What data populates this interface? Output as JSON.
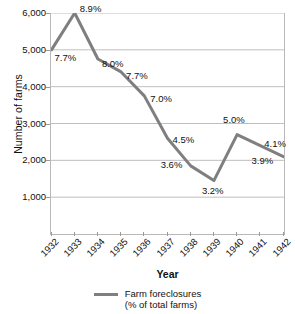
{
  "chart_data": {
    "type": "line",
    "title": "",
    "xlabel": "Year",
    "ylabel": "Number of farms",
    "categories": [
      "1932",
      "1933",
      "1934",
      "1935",
      "1936",
      "1937",
      "1938",
      "1939",
      "1940",
      "1941",
      "1942"
    ],
    "values": [
      5000,
      6000,
      4750,
      4400,
      3750,
      2600,
      1850,
      1450,
      2700,
      2400,
      2100
    ],
    "point_labels": [
      "7.7%",
      "8.9%",
      "8.0%",
      "7.7%",
      "7.0%",
      "4.5%",
      "3.6%",
      "3.2%",
      "5.0%",
      "4.1%",
      "3.9%"
    ],
    "series": [
      {
        "name": "Farm foreclosures (% of total farms)",
        "values": [
          5000,
          6000,
          4750,
          4400,
          3750,
          2600,
          1850,
          1450,
          2700,
          2400,
          2100
        ],
        "percent_of_total_farms": [
          7.7,
          8.9,
          8.0,
          7.7,
          7.0,
          4.5,
          3.6,
          3.2,
          5.0,
          4.1,
          3.9
        ],
        "color": "#7f7f7f"
      }
    ],
    "ylim": [
      0,
      6000
    ],
    "y_ticks": [
      6000,
      5000,
      4000,
      3000,
      2000,
      1000
    ],
    "y_tick_labels": [
      "6,000",
      "5,000",
      "4,000",
      "3,000",
      "2,000",
      "1,000"
    ],
    "grid": true,
    "grid_axis": "y",
    "legend_position": "bottom",
    "legend": [
      "Farm foreclosures",
      "(% of total farms)"
    ]
  },
  "axes": {
    "y_title": "Number of farms",
    "x_title": "Year"
  },
  "legend": {
    "line1": "Farm foreclosures",
    "line2": "(% of total farms)"
  },
  "colors": {
    "line": "#7f7f7f",
    "grid": "#bfbfbf",
    "border": "#b9b9b9",
    "text": "#111111",
    "background": "#ffffff"
  }
}
